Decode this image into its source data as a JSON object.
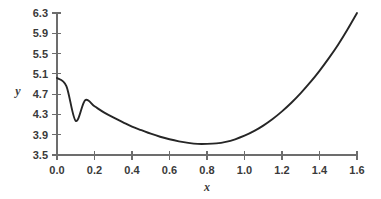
{
  "chart_data": {
    "type": "line",
    "title": "",
    "subtitle": "",
    "xlabel": "x",
    "ylabel": "y",
    "xlim": [
      0.0,
      1.6
    ],
    "ylim": [
      3.5,
      6.3
    ],
    "grid": false,
    "legend": null,
    "x_ticks": [
      "0.0",
      "0.2",
      "0.4",
      "0.6",
      "0.8",
      "1.0",
      "1.2",
      "1.4",
      "1.6"
    ],
    "x_tick_values": [
      0.0,
      0.2,
      0.4,
      0.6,
      0.8,
      1.0,
      1.2,
      1.4,
      1.6
    ],
    "y_ticks": [
      "3.5",
      "3.9",
      "4.3",
      "4.7",
      "5.1",
      "5.5",
      "5.9",
      "6.3"
    ],
    "y_tick_values": [
      3.5,
      3.9,
      4.3,
      4.7,
      5.1,
      5.5,
      5.9,
      6.3
    ],
    "series": [
      {
        "name": "curve",
        "color": "#262626",
        "x": [
          0.0,
          0.05,
          0.1,
          0.15,
          0.2,
          0.25,
          0.3,
          0.35,
          0.4,
          0.45,
          0.5,
          0.55,
          0.6,
          0.65,
          0.7,
          0.75,
          0.8,
          0.85,
          0.9,
          0.95,
          1.0,
          1.05,
          1.1,
          1.15,
          1.2,
          1.25,
          1.3,
          1.35,
          1.4,
          1.45,
          1.5,
          1.55,
          1.6
        ],
        "y": [
          5.02,
          4.86,
          4.173,
          4.58,
          4.46,
          4.34,
          4.24,
          4.15,
          4.06,
          3.99,
          3.92,
          3.86,
          3.81,
          3.77,
          3.74,
          3.72,
          3.72,
          3.73,
          3.76,
          3.81,
          3.88,
          3.97,
          4.08,
          4.21,
          4.36,
          4.53,
          4.72,
          4.93,
          5.16,
          5.41,
          5.68,
          5.98,
          6.3
        ]
      }
    ],
    "annotations": []
  },
  "plot": {
    "x_axis_label": "x",
    "y_axis_label": "y"
  }
}
